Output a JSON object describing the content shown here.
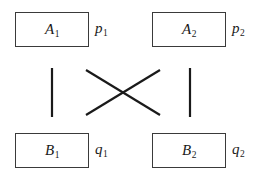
{
  "diagram": {
    "type": "bipartite-crossing-diagram",
    "background_color": "#ffffff",
    "stroke_color": "#1a1a1a",
    "box_border_color": "#3a3a3a",
    "nodes": [
      {
        "id": "a1",
        "label_base": "A",
        "label_sub": "1",
        "position": "top-left"
      },
      {
        "id": "a2",
        "label_base": "A",
        "label_sub": "2",
        "position": "top-right"
      },
      {
        "id": "b1",
        "label_base": "B",
        "label_sub": "1",
        "position": "bottom-left"
      },
      {
        "id": "b2",
        "label_base": "B",
        "label_sub": "2",
        "position": "bottom-right"
      }
    ],
    "side_labels": [
      {
        "id": "p1",
        "label_base": "p",
        "label_sub": "1",
        "attached_to": "a1"
      },
      {
        "id": "p2",
        "label_base": "p",
        "label_sub": "2",
        "attached_to": "a2"
      },
      {
        "id": "q1",
        "label_base": "q",
        "label_sub": "1",
        "attached_to": "b1"
      },
      {
        "id": "q2",
        "label_base": "q",
        "label_sub": "2",
        "attached_to": "b2"
      }
    ],
    "edges": [
      {
        "id": "edge-left-vertical",
        "from": "a1",
        "to": "b1",
        "kind": "vertical",
        "x1": 52,
        "y1": 68,
        "x2": 52,
        "y2": 117
      },
      {
        "id": "edge-right-vertical",
        "from": "a2",
        "to": "b2",
        "kind": "vertical",
        "x1": 190,
        "y1": 68,
        "x2": 190,
        "y2": 117
      },
      {
        "id": "edge-diagonal-a1-b2",
        "from": "a1",
        "to": "b2",
        "kind": "diagonal",
        "x1": 86,
        "y1": 70,
        "x2": 160,
        "y2": 115
      },
      {
        "id": "edge-diagonal-a2-b1",
        "from": "a2",
        "to": "b1",
        "kind": "diagonal",
        "x1": 160,
        "y1": 70,
        "x2": 86,
        "y2": 115
      }
    ]
  }
}
